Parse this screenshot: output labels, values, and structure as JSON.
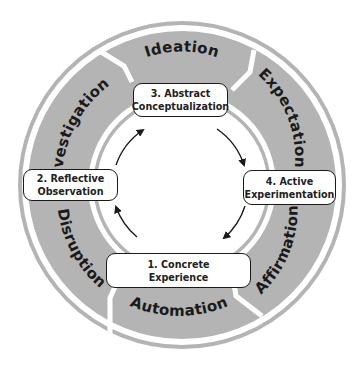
{
  "diagram": {
    "type": "cycle",
    "colors": {
      "band": "#b4b4b4",
      "outer_ring": "#b4b4b4",
      "inner_ring": "#b4b4b4",
      "box_border": "#1a1a1a",
      "arrow": "#1a1a1a",
      "text": "#1a1a1a"
    },
    "stages": [
      {
        "id": "concrete",
        "line1": "1. Concrete",
        "line2": "Experience"
      },
      {
        "id": "reflective",
        "line1": "2. Reflective",
        "line2": "Observation"
      },
      {
        "id": "abstract",
        "line1": "3. Abstract",
        "line2": "Conceptualization"
      },
      {
        "id": "active",
        "line1": "4. Active",
        "line2": "Experimentation"
      }
    ],
    "band_segments": [
      {
        "label": "Ideation"
      },
      {
        "label": "Expectation"
      },
      {
        "label": "Affirmation"
      },
      {
        "label": "Automation"
      },
      {
        "label": "Disruption"
      },
      {
        "label": "Investigation"
      }
    ],
    "arrow_direction": "clockwise"
  }
}
